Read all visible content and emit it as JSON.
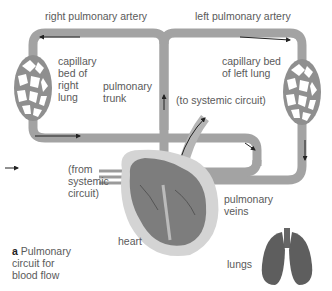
{
  "figure": {
    "panel_letter": "a",
    "caption": "Pulmonary\ncircuit for\nblood flow"
  },
  "labels": {
    "right_pulmonary_artery": "right pulmonary artery",
    "left_pulmonary_artery": "left pulmonary artery",
    "capillary_right": "capillary\nbed of\nright\nlung",
    "capillary_left": "capillary bed\nof left lung",
    "pulmonary_trunk": "pulmonary\ntrunk",
    "to_systemic": "(to systemic circuit)",
    "from_systemic": "(from\nsystemic\ncircuit)",
    "pulmonary_veins": "pulmonary\nveins",
    "heart": "heart",
    "lungs": "lungs"
  },
  "colors": {
    "vessel": "#a3a3a3",
    "vessel_edge": "#8a8a8a",
    "arrow": "#2a2a2a",
    "heart_fill": "#7d7d7d",
    "heart_outer": "#d4d4d4",
    "lung_fill": "#5e5e5e",
    "text": "#5a5a5a"
  }
}
